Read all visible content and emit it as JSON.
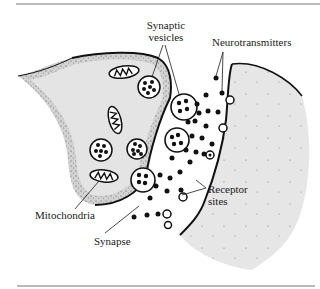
{
  "figure": {
    "type": "diagram",
    "labels": {
      "synaptic_vesicles": [
        "Synaptic",
        "vesicles"
      ],
      "neurotransmitters": "Neurotransmitters",
      "mitochondria": "Mitochondria",
      "synapse": "Synapse",
      "receptor_sites": [
        "Receptor",
        "sites"
      ]
    },
    "colors": {
      "cell_fill": "#e4e4e4",
      "outline": "#111111",
      "cleft": "#ffffff",
      "rule": "#777777"
    }
  }
}
